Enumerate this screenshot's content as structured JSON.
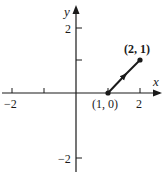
{
  "diagram": {
    "type": "coordinate-plane-vector",
    "axes": {
      "x_label": "x",
      "y_label": "y",
      "x_ticks": [
        {
          "value": -2,
          "label": "−2"
        },
        {
          "value": -1,
          "label": ""
        },
        {
          "value": 1,
          "label": ""
        },
        {
          "value": 2,
          "label": "2"
        }
      ],
      "y_ticks": [
        {
          "value": 2,
          "label": "2"
        },
        {
          "value": 1,
          "label": ""
        },
        {
          "value": -2,
          "label": "−2"
        }
      ]
    },
    "vector": {
      "start": {
        "x": 1,
        "y": 0,
        "label": "(1, 0)"
      },
      "end": {
        "x": 2,
        "y": 1,
        "label": "(2, 1)"
      }
    },
    "colors": {
      "ink": "#1a1a1a",
      "background": "#ffffff"
    }
  }
}
